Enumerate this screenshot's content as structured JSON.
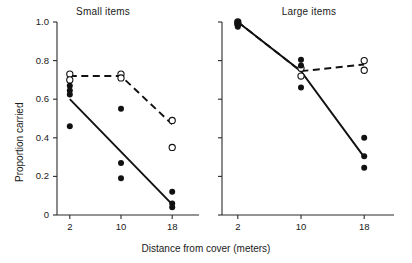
{
  "figure": {
    "ylabel": "Proportion carried",
    "xlabel": "Distance from cover (meters)"
  },
  "chart_data": [
    {
      "type": "scatter",
      "title": "Small items",
      "xlabel": "",
      "ylabel": "Proportion carried",
      "x": [
        2,
        10,
        18
      ],
      "xlim": [
        0,
        20
      ],
      "ylim": [
        0,
        1.0
      ],
      "xticks": [
        2,
        10,
        18
      ],
      "xtick_labels": [
        "2",
        "10",
        "18"
      ],
      "yticks": [
        0,
        0.2,
        0.4,
        0.6,
        0.8,
        1.0
      ],
      "ytick_labels": [
        "0",
        "0.2",
        "0.4",
        "0.6",
        "0.8",
        "1.0"
      ],
      "grid": false,
      "legend": "none",
      "series": [
        {
          "name": "open-circles",
          "marker": "open circle",
          "line": "dashed",
          "points": [
            {
              "x": 2,
              "y": 0.73
            },
            {
              "x": 2,
              "y": 0.7
            },
            {
              "x": 10,
              "y": 0.73
            },
            {
              "x": 10,
              "y": 0.71
            },
            {
              "x": 18,
              "y": 0.49
            },
            {
              "x": 18,
              "y": 0.35
            }
          ],
          "fit_line": [
            {
              "x": 2,
              "y": 0.72
            },
            {
              "x": 10,
              "y": 0.72
            },
            {
              "x": 18,
              "y": 0.47
            }
          ]
        },
        {
          "name": "filled-circles",
          "marker": "filled circle",
          "line": "solid",
          "points": [
            {
              "x": 2,
              "y": 0.67
            },
            {
              "x": 2,
              "y": 0.645
            },
            {
              "x": 2,
              "y": 0.625
            },
            {
              "x": 2,
              "y": 0.46
            },
            {
              "x": 10,
              "y": 0.55
            },
            {
              "x": 10,
              "y": 0.27
            },
            {
              "x": 10,
              "y": 0.19
            },
            {
              "x": 18,
              "y": 0.12
            },
            {
              "x": 18,
              "y": 0.06
            },
            {
              "x": 18,
              "y": 0.04
            }
          ],
          "fit_line": [
            {
              "x": 2,
              "y": 0.6
            },
            {
              "x": 18,
              "y": 0.055
            }
          ]
        }
      ]
    },
    {
      "type": "scatter",
      "title": "Large items",
      "xlabel": "",
      "ylabel": "",
      "x": [
        2,
        10,
        18
      ],
      "xlim": [
        0,
        20
      ],
      "ylim": [
        0,
        1.0
      ],
      "xticks": [
        2,
        10,
        18
      ],
      "xtick_labels": [
        "2",
        "10",
        "18"
      ],
      "yticks": [
        0,
        0.2,
        0.4,
        0.6,
        0.8,
        1.0
      ],
      "ytick_labels": [
        "",
        "",
        "",
        "",
        "",
        ""
      ],
      "grid": false,
      "legend": "none",
      "series": [
        {
          "name": "open-circles",
          "marker": "open circle",
          "line": "dashed",
          "points": [
            {
              "x": 2,
              "y": 1.0
            },
            {
              "x": 2,
              "y": 0.99
            },
            {
              "x": 10,
              "y": 0.76
            },
            {
              "x": 10,
              "y": 0.72
            },
            {
              "x": 18,
              "y": 0.8
            },
            {
              "x": 18,
              "y": 0.75
            }
          ],
          "fit_line": [
            {
              "x": 2,
              "y": 1.0
            },
            {
              "x": 10,
              "y": 0.745
            },
            {
              "x": 18,
              "y": 0.78
            }
          ]
        },
        {
          "name": "filled-circles",
          "marker": "filled circle",
          "line": "solid",
          "points": [
            {
              "x": 2,
              "y": 1.0
            },
            {
              "x": 2,
              "y": 0.995
            },
            {
              "x": 2,
              "y": 0.985
            },
            {
              "x": 2,
              "y": 0.975
            },
            {
              "x": 10,
              "y": 0.805
            },
            {
              "x": 10,
              "y": 0.775
            },
            {
              "x": 10,
              "y": 0.66
            },
            {
              "x": 18,
              "y": 0.4
            },
            {
              "x": 18,
              "y": 0.305
            },
            {
              "x": 18,
              "y": 0.245
            }
          ],
          "fit_line": [
            {
              "x": 2,
              "y": 1.0
            },
            {
              "x": 10,
              "y": 0.745
            },
            {
              "x": 18,
              "y": 0.3
            }
          ]
        }
      ]
    }
  ]
}
